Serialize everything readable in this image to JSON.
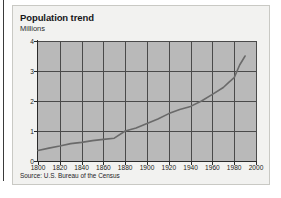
{
  "card": {
    "title": "Population trend",
    "subtitle": "Millions",
    "source": "Source: U.S. Bureau of the Census"
  },
  "colors": {
    "plot_background": "#b9b9b9",
    "grid": "#4a4a4a",
    "axis": "#2b2b2b",
    "series_line": "#6a6a6a",
    "card_background": "#f2f2f0",
    "card_border": "#c9c9c4",
    "text": "#17171a"
  },
  "chart_data": {
    "type": "line",
    "title": "Population trend",
    "subtitle": "Millions",
    "xlabel": "",
    "ylabel": "Millions",
    "xlim": [
      1800,
      2000
    ],
    "ylim": [
      0,
      4
    ],
    "xticks": [
      1800,
      1820,
      1840,
      1860,
      1880,
      1900,
      1920,
      1940,
      1960,
      1980,
      2000
    ],
    "yticks": [
      0,
      1,
      2,
      3,
      4
    ],
    "xtick_labels": [
      "1800",
      "1820",
      "1840",
      "1860",
      "1880",
      "1900",
      "1920",
      "1940",
      "1960",
      "1980",
      "2000"
    ],
    "ytick_labels": [
      "0",
      "1",
      "2",
      "3",
      "4"
    ],
    "grid": true,
    "legend": "none",
    "series": [
      {
        "name": "Population",
        "x": [
          1800,
          1810,
          1820,
          1830,
          1840,
          1850,
          1860,
          1870,
          1880,
          1890,
          1900,
          1910,
          1920,
          1930,
          1940,
          1950,
          1960,
          1970,
          1975,
          1980,
          1985,
          1990
        ],
        "values": [
          0.35,
          0.43,
          0.5,
          0.58,
          0.62,
          0.68,
          0.72,
          0.76,
          1.0,
          1.1,
          1.25,
          1.4,
          1.58,
          1.72,
          1.82,
          2.0,
          2.22,
          2.45,
          2.62,
          2.78,
          3.2,
          3.5
        ]
      }
    ]
  }
}
